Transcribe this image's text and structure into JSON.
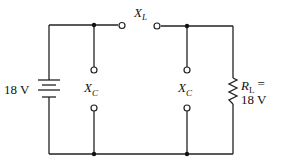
{
  "diagram": {
    "type": "circuit",
    "source": {
      "label": "18 V",
      "component": "battery"
    },
    "series_element": {
      "symbol": "X",
      "subscript": "L",
      "component": "inductive-reactance-terminals"
    },
    "shunt_elements": [
      {
        "symbol": "X",
        "subscript": "C",
        "component": "capacitive-reactance-terminals"
      },
      {
        "symbol": "X",
        "subscript": "C",
        "component": "capacitive-reactance-terminals"
      }
    ],
    "load": {
      "symbol": "R",
      "subscript": "L",
      "equals": "=",
      "value": "18 V",
      "component": "resistor"
    }
  }
}
